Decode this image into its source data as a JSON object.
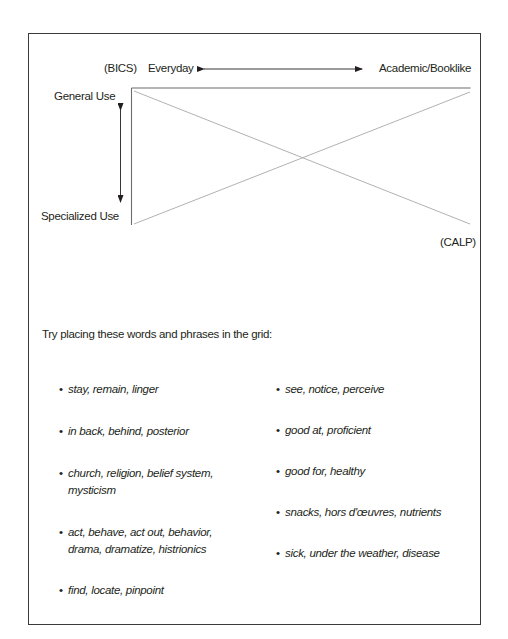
{
  "diagram": {
    "labels": {
      "bics": "(BICS)",
      "everyday": "Everyday",
      "academic": "Academic/Booklike",
      "general_use": "General Use",
      "specialized_use": "Specialized Use",
      "calp": "(CALP)"
    },
    "colors": {
      "frame": "#3a3a3a",
      "grid_axis": "#6d6d6d",
      "diagonal": "#a8a8a8",
      "arrow": "#231f20"
    }
  },
  "instructions": {
    "prompt": "Try placing these words and phrases in the grid:"
  },
  "word_lists": {
    "left": [
      {
        "text": "stay, remain, linger"
      },
      {
        "text": "in back, behind, posterior"
      },
      {
        "text": "church, religion, belief system, mysticism"
      },
      {
        "text": "act, behave, act out, behavior, drama, dramatize, histrionics"
      },
      {
        "text": "find, locate, pinpoint"
      }
    ],
    "right": [
      {
        "text": "see, notice, perceive"
      },
      {
        "text": "good at, proficient"
      },
      {
        "text": "good for, healthy"
      },
      {
        "text": "snacks, hors d'œuvres, nutrients"
      },
      {
        "text": "sick, under the weather, disease"
      }
    ],
    "bullet": "•"
  }
}
